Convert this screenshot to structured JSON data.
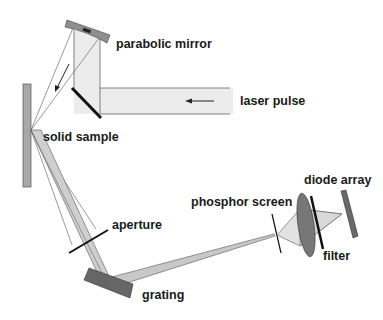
{
  "diagram": {
    "labels": {
      "parabolic_mirror": "parabolic mirror",
      "laser_pulse": "laser pulse",
      "solid_sample": "solid sample",
      "aperture": "aperture",
      "grating": "grating",
      "phosphor_screen": "phosphor screen",
      "diode_array": "diode array",
      "filter": "filter"
    },
    "colors": {
      "beam_fill": "#ececec",
      "beam_edge": "#555555",
      "component_fill": "#8a8a8a",
      "component_dark": "#666666",
      "sample_fill": "#a8a8a8",
      "line": "#111111",
      "harmonic_beam": "#c8c8c8"
    }
  }
}
